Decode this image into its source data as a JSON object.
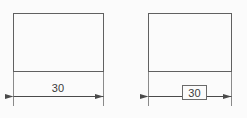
{
  "drawing": {
    "title": "Dimension comparison: directly toleranced vs. basic dimension",
    "background_color": "#fbfbfb",
    "line_color": "#555555",
    "text_color": "#3a3a3a",
    "line_width": 1,
    "figures": [
      {
        "id": "left-figure",
        "name": "toleranced-dimension-figure",
        "part": {
          "shape": "rectangle",
          "x": 13,
          "y": 13,
          "width": 91,
          "height": 59
        },
        "dimension": {
          "value": "30",
          "boxed": false,
          "type": "directly-toleranced",
          "line_y": 96,
          "start_x": 13,
          "end_x": 104,
          "text_x": 58,
          "text_y": 92,
          "extension_line_top_y": 72,
          "extension_line_bottom_y": 106,
          "arrow_direction": "inward"
        }
      },
      {
        "id": "right-figure",
        "name": "basic-dimension-figure",
        "part": {
          "shape": "rectangle",
          "x": 148,
          "y": 13,
          "width": 84,
          "height": 59
        },
        "dimension": {
          "value": "30",
          "boxed": true,
          "type": "basic-theoretically-exact",
          "line_y": 96,
          "start_x": 148,
          "end_x": 232,
          "text_x": 194,
          "text_y": 96,
          "box": {
            "x": 182,
            "y": 85,
            "width": 25,
            "height": 15
          },
          "extension_line_top_y": 72,
          "extension_line_bottom_y": 106,
          "arrow_direction": "inward"
        }
      }
    ]
  }
}
